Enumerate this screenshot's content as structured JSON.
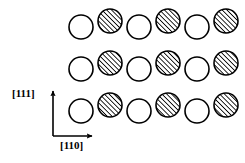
{
  "figure": {
    "title": "",
    "width": 245,
    "height": 163,
    "background_color": "#ffffff",
    "stroke_color": "#000000"
  },
  "axes": {
    "origin": {
      "x": 53,
      "y": 136
    },
    "vertical": {
      "label": "[111]",
      "label_x": 12,
      "label_y": 88,
      "from_y": 136,
      "to_y": 91,
      "x": 53
    },
    "horizontal": {
      "label": "[110]",
      "label_x": 60,
      "label_y": 140,
      "from_x": 53,
      "to_x": 92,
      "y": 136
    }
  },
  "legend": {
    "open_circle_meaning": "lower-plane atom",
    "hatched_circle_meaning": "upper-plane atom"
  },
  "chart_data": {
    "type": "scatter",
    "title": "",
    "xlabel": "[110]",
    "ylabel": "[111]",
    "grid": false,
    "legend_position": "none",
    "circle_radius": 12,
    "stroke_width": 1.6,
    "hatch_angle_deg": 45,
    "hatch_spacing": 2.4,
    "hatch_color": "#000000",
    "open_fill": "#ffffff",
    "row_spacing": 42,
    "column_spacing": 29,
    "hatched_offset_y": -6,
    "series": [
      {
        "name": "open-circles",
        "fill": "open",
        "points": [
          {
            "cx": 81,
            "cy": 27
          },
          {
            "cx": 139,
            "cy": 27
          },
          {
            "cx": 197,
            "cy": 27
          },
          {
            "cx": 81,
            "cy": 69
          },
          {
            "cx": 139,
            "cy": 69
          },
          {
            "cx": 197,
            "cy": 69
          },
          {
            "cx": 81,
            "cy": 111
          },
          {
            "cx": 139,
            "cy": 111
          },
          {
            "cx": 197,
            "cy": 111
          }
        ]
      },
      {
        "name": "hatched-circles",
        "fill": "hatched",
        "points": [
          {
            "cx": 110,
            "cy": 21
          },
          {
            "cx": 168,
            "cy": 21
          },
          {
            "cx": 226,
            "cy": 21
          },
          {
            "cx": 110,
            "cy": 63
          },
          {
            "cx": 168,
            "cy": 63
          },
          {
            "cx": 226,
            "cy": 63
          },
          {
            "cx": 110,
            "cy": 105
          },
          {
            "cx": 168,
            "cy": 105
          },
          {
            "cx": 226,
            "cy": 105
          }
        ]
      }
    ]
  }
}
